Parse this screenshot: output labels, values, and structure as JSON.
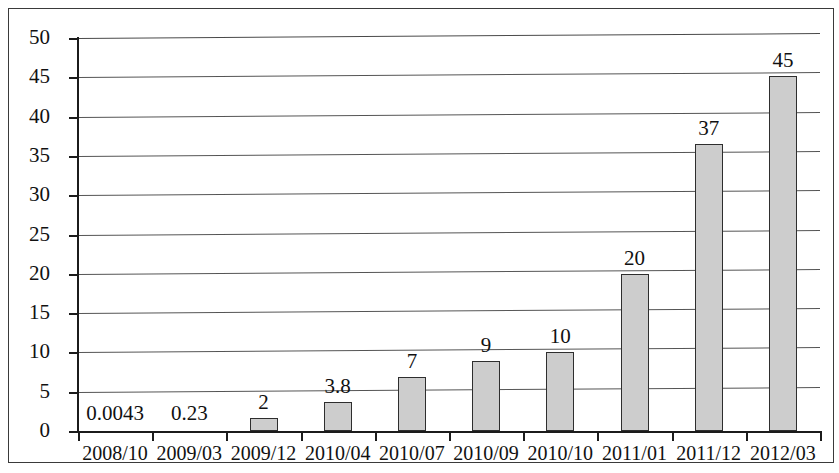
{
  "chart_data": {
    "type": "bar",
    "title": "",
    "subtitle": "",
    "xlabel": "",
    "ylabel": "",
    "categories": [
      "2008/10",
      "2009/03",
      "2009/12",
      "2010/04",
      "2010/07",
      "2010/09",
      "2010/10",
      "2011/01",
      "2011/12",
      "2012/03"
    ],
    "values": [
      0.0043,
      0.23,
      2,
      3.8,
      7,
      9,
      10,
      20,
      37,
      45
    ],
    "value_labels": [
      "0.0043",
      "0.23",
      "2",
      "3.8",
      "7",
      "9",
      "10",
      "20",
      "37",
      "45"
    ],
    "drawn_heights": [
      0,
      0,
      1.5,
      3.5,
      6.6,
      8.6,
      9.7,
      19.5,
      36.0,
      44.5
    ],
    "ylim": [
      0,
      50
    ],
    "ytick_values": [
      0,
      5,
      10,
      15,
      20,
      25,
      30,
      35,
      40,
      45,
      50
    ],
    "ytick_labels": [
      "0",
      "5",
      "10",
      "15",
      "20",
      "25",
      "30",
      "35",
      "40",
      "45",
      "50"
    ],
    "grid": true,
    "grid_axis": "y",
    "legend": null,
    "legend_position": "none",
    "series": [
      {
        "name": "",
        "values": [
          0.0043,
          0.23,
          2,
          3.8,
          7,
          9,
          10,
          20,
          37,
          45
        ]
      }
    ],
    "colors": {
      "bar_fill": "#cdcdcd",
      "bar_stroke": "#2e2e2e",
      "gridline": "#555555",
      "axis": "#1b1b1b",
      "text": "#111111",
      "background": "#ffffff",
      "frame": "#3a3a3a"
    }
  }
}
